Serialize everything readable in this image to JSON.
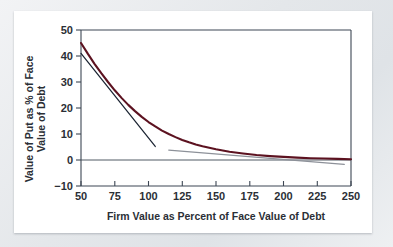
{
  "figure": {
    "background_color": "#ffffff",
    "page_background_color": "#e9ebee"
  },
  "chart_data": {
    "type": "line",
    "title": "",
    "xlabel": "Firm Value as Percent of Face Value of Debt",
    "ylabel": "Value of Put as % of Face Value of Debt",
    "ylabel_line1": "Value of Put as % of Face",
    "ylabel_line2": "Value of Debt",
    "xlim": [
      50,
      250
    ],
    "ylim": [
      -10,
      50
    ],
    "xticks": [
      50,
      75,
      100,
      125,
      150,
      175,
      200,
      225,
      250
    ],
    "xticklabels": [
      "50",
      "75",
      "100",
      "125",
      "150",
      "175",
      "200",
      "225",
      "250"
    ],
    "yticks": [
      -10,
      0,
      10,
      20,
      30,
      40,
      50
    ],
    "yticklabels": [
      "−10",
      "0",
      "10",
      "20",
      "30",
      "40",
      "50"
    ],
    "grid": false,
    "legend": false,
    "zero_line": 0,
    "series": [
      {
        "name": "Value of put option",
        "color": "#5c1220",
        "style": "solid",
        "width": 2.1,
        "x": [
          50,
          55,
          60,
          65,
          70,
          75,
          80,
          85,
          90,
          95,
          100,
          105,
          110,
          115,
          120,
          125,
          130,
          135,
          140,
          145,
          150,
          160,
          170,
          180,
          190,
          200,
          210,
          220,
          230,
          240,
          250
        ],
        "y": [
          45.0,
          40.9,
          37.0,
          33.4,
          30.0,
          26.8,
          23.9,
          21.2,
          18.8,
          16.6,
          14.6,
          12.9,
          11.3,
          10.0,
          8.8,
          7.7,
          6.8,
          6.0,
          5.3,
          4.7,
          4.1,
          3.2,
          2.5,
          1.9,
          1.5,
          1.2,
          0.9,
          0.7,
          0.55,
          0.42,
          0.3
        ]
      },
      {
        "name": "Tangent at low firm value",
        "color": "#1b2432",
        "style": "solid",
        "width": 1.25,
        "x": [
          50,
          105
        ],
        "y": [
          41.0,
          5.2
        ]
      },
      {
        "name": "Tangent at high firm value",
        "color": "#8d9199",
        "style": "solid",
        "width": 1.25,
        "x": [
          115,
          245
        ],
        "y": [
          3.8,
          -1.7
        ]
      }
    ]
  }
}
